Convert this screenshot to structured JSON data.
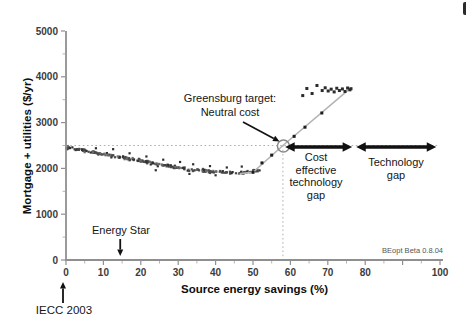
{
  "chart_data": {
    "type": "scatter",
    "title": "",
    "xlabel": "Source energy savings (%)",
    "ylabel": "Mortgage + utilities ($/yr)",
    "xlim": [
      0,
      100
    ],
    "ylim": [
      0,
      5000
    ],
    "x_ticks": [
      0,
      10,
      20,
      30,
      40,
      50,
      60,
      70,
      80,
      90,
      100
    ],
    "x_tick_labels": [
      "0",
      "10",
      "20",
      "30",
      "40",
      "50",
      "60",
      "70",
      "80",
      "",
      "100"
    ],
    "x_minor_step": 5,
    "y_ticks": [
      0,
      1000,
      2000,
      3000,
      4000,
      5000
    ],
    "y_tick_labels": [
      "0",
      "1000",
      "2000",
      "3000",
      "4000",
      "5000"
    ],
    "y_minor_step": 500,
    "grid": false,
    "neutral_cost_y": 2500,
    "target_x": 58,
    "target_point": [
      58,
      2500
    ],
    "cost_gap_span": [
      58.6,
      76.5
    ],
    "tech_gap_span": [
      77.6,
      99
    ],
    "energy_star_x": 14.5,
    "iecc_2003_x": 0,
    "cloud": {
      "trend": [
        [
          0,
          2460
        ],
        [
          5,
          2390
        ],
        [
          10,
          2315
        ],
        [
          15,
          2240
        ],
        [
          20,
          2165
        ],
        [
          25,
          2085
        ],
        [
          30,
          2015
        ],
        [
          35,
          1960
        ],
        [
          40,
          1925
        ],
        [
          44,
          1905
        ],
        [
          48,
          1910
        ],
        [
          52,
          1965
        ]
      ],
      "n_points": 240,
      "x_min": 0,
      "x_max": 52,
      "y_jitter": 48,
      "seed": 11,
      "outliers": [
        [
          12.6,
          2420
        ],
        [
          17,
          2330
        ],
        [
          21.5,
          2260
        ],
        [
          26,
          2190
        ],
        [
          30.5,
          2140
        ],
        [
          34,
          2090
        ],
        [
          38.5,
          2050
        ],
        [
          43,
          2020
        ],
        [
          47,
          2040
        ],
        [
          24,
          1960
        ],
        [
          33,
          1880
        ],
        [
          40,
          1850
        ],
        [
          8,
          2440
        ]
      ]
    },
    "path_line": [
      [
        46.5,
        1885
      ],
      [
        50,
        1915
      ],
      [
        58,
        2500
      ],
      [
        76,
        3745
      ]
    ],
    "path_markers": [
      [
        50,
        1915
      ],
      [
        52.4,
        2120
      ],
      [
        55,
        2290
      ],
      [
        61,
        2700
      ],
      [
        63.9,
        2900
      ],
      [
        68.4,
        3210
      ]
    ],
    "cluster_points": [
      [
        63.3,
        3590
      ],
      [
        64.4,
        3745
      ],
      [
        65.8,
        3635
      ],
      [
        67.1,
        3810
      ],
      [
        68.5,
        3700
      ],
      [
        69.3,
        3760
      ],
      [
        70.1,
        3690
      ],
      [
        70.9,
        3730
      ],
      [
        71.7,
        3670
      ],
      [
        72.4,
        3750
      ],
      [
        73.1,
        3700
      ],
      [
        73.9,
        3735
      ],
      [
        74.6,
        3680
      ],
      [
        75.3,
        3755
      ],
      [
        75.9,
        3715
      ],
      [
        76.2,
        3740
      ]
    ]
  },
  "annotations": {
    "greensburg": "Greensburg target:\nNeutral cost",
    "cost_gap": "Cost\neffective\ntechnology\ngap",
    "tech_gap": "Technology\ngap",
    "energy_star": "Energy Star",
    "iecc": "IECC 2003",
    "version": "BEopt Beta 0.8.04"
  },
  "colors": {
    "point_dark": "#2f2f2f",
    "point_mid": "#4a4a4a",
    "point_light": "#6b6b6b",
    "path_line": "#b4b4b4",
    "reference_dotted": "#b0b0b0",
    "axis": "#8f8f8f",
    "tick_label": "#3c3c3c",
    "arrow": "#111111",
    "target_circle": "#8a8a8a"
  }
}
